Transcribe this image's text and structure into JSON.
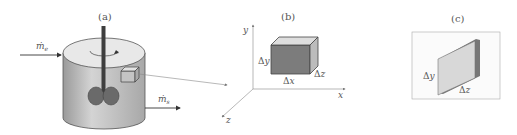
{
  "panels": {
    "a": {
      "label": "(a)",
      "inflow_label": "ṁ",
      "inflow_sub": "e",
      "outflow_label": "ṁ",
      "outflow_sub": "s"
    },
    "b": {
      "label": "(b)",
      "axis_x": "x",
      "axis_y": "y",
      "axis_z": "z",
      "dim_x": "Δx",
      "dim_y": "Δy",
      "dim_z": "Δz"
    },
    "c": {
      "label": "(c)",
      "dim_y": "Δy",
      "dim_z": "Δz"
    }
  },
  "colors": {
    "tank_body": "#b8b8b8",
    "tank_top": "#e6e6e6",
    "impeller": "#666666",
    "shaft": "#444444",
    "cube_front": "#7a7a7a",
    "cube_top": "#dcdcdc",
    "cube_side": "#bdbdbd",
    "plate_face": "#d6d6d6",
    "plate_edge": "#777777"
  }
}
